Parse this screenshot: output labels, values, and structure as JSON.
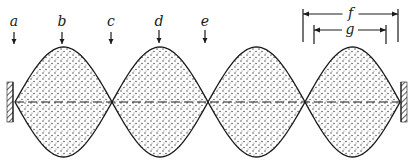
{
  "diagram": {
    "colors": {
      "ink": "#1a1a1a",
      "stipple": "#333333",
      "background": "#ffffff"
    },
    "axis_y": 102,
    "amplitude": 55,
    "nodes_x": [
      15,
      112,
      208,
      305,
      400
    ],
    "position_labels": [
      {
        "text": "a",
        "x": 14,
        "label_y": 14,
        "arrow_top": 32,
        "arrow_bottom": 44
      },
      {
        "text": "b",
        "x": 62,
        "label_y": 14,
        "arrow_top": 32,
        "arrow_bottom": 44
      },
      {
        "text": "c",
        "x": 111,
        "label_y": 14,
        "arrow_top": 32,
        "arrow_bottom": 44
      },
      {
        "text": "d",
        "x": 159,
        "label_y": 14,
        "arrow_top": 30,
        "arrow_bottom": 43
      },
      {
        "text": "e",
        "x": 205,
        "label_y": 14,
        "arrow_top": 30,
        "arrow_bottom": 43
      }
    ],
    "dimensions": [
      {
        "text": "f",
        "x1": 303,
        "x2": 398,
        "y": 14,
        "tick_top": 9,
        "tick_bottom": 42
      },
      {
        "text": "g",
        "x1": 314,
        "x2": 386,
        "y": 30,
        "tick_top": 25,
        "tick_bottom": 44
      }
    ]
  }
}
